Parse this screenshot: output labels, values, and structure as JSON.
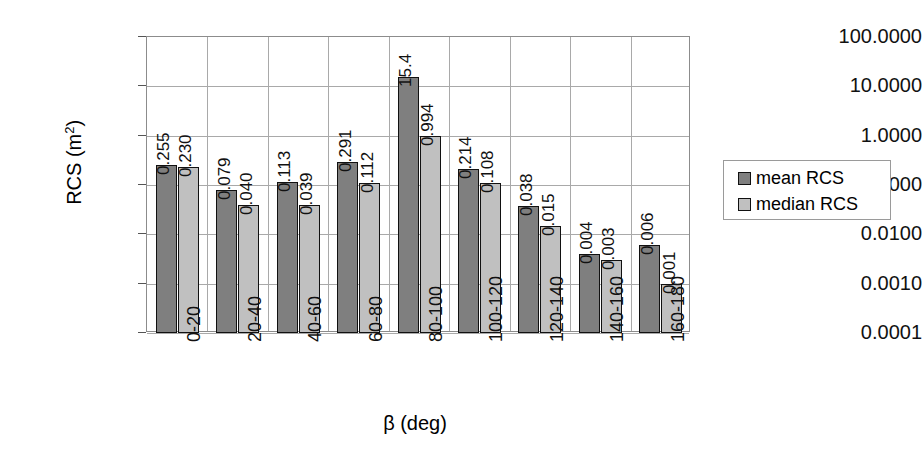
{
  "chart_data": {
    "type": "bar",
    "title": "",
    "xlabel": "β (deg)",
    "ylabel": "RCS (m²)",
    "yscale": "log",
    "ylim": [
      0.0001,
      100
    ],
    "grid": true,
    "legend_position": "right",
    "categories": [
      "0-20",
      "20-40",
      "40-60",
      "60-80",
      "80-100",
      "100-120",
      "120-140",
      "140-160",
      "160-180"
    ],
    "ytick_labels": [
      "100.0000",
      "10.0000",
      "1.0000",
      "0.1000",
      "0.0100",
      "0.0010",
      "0.0001"
    ],
    "ytick_values": [
      100,
      10,
      1,
      0.1,
      0.01,
      0.001,
      0.0001
    ],
    "series": [
      {
        "name": "mean RCS",
        "color": "#7f7f7f",
        "values": [
          0.255,
          0.079,
          0.113,
          0.291,
          15.4,
          0.214,
          0.038,
          0.004,
          0.006
        ],
        "labels": [
          "0.255",
          "0.079",
          "0.113",
          "0.291",
          "15.4",
          "0.214",
          "0.038",
          "0.004",
          "0.006"
        ]
      },
      {
        "name": "median RCS",
        "color": "#c0c0c0",
        "values": [
          0.23,
          0.04,
          0.039,
          0.112,
          0.994,
          0.108,
          0.015,
          0.003,
          0.001
        ],
        "labels": [
          "0.230",
          "0.040",
          "0.039",
          "0.112",
          "0.994",
          "0.108",
          "0.015",
          "0.003",
          "0.001"
        ]
      }
    ]
  },
  "legend": {
    "items": [
      {
        "label": "mean RCS",
        "swatch": "mean"
      },
      {
        "label": "median RCS",
        "swatch": "median"
      }
    ]
  },
  "axis_titles": {
    "x": "β (deg)",
    "y_prefix": "RCS (m",
    "y_exponent": "2",
    "y_suffix": ")"
  }
}
